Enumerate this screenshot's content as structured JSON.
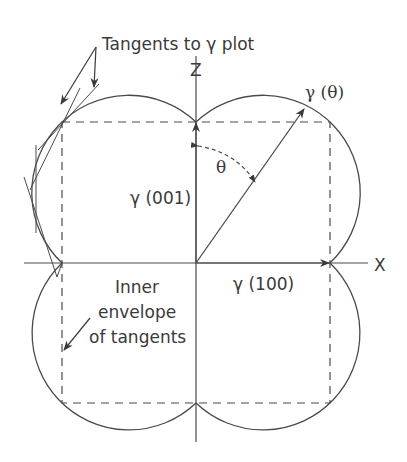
{
  "diagram": {
    "labels": {
      "tangents": "Tangents to γ plot",
      "z_axis": "Z",
      "x_axis": "X",
      "gamma_theta": "γ (θ)",
      "theta": "θ",
      "gamma_001": "γ (001)",
      "gamma_100": "γ (100)",
      "inner_envelope_line1": "Inner",
      "inner_envelope_line2": "envelope",
      "inner_envelope_line3": "of tangents"
    },
    "colors": {
      "stroke": "#4a4a4a",
      "text": "#3a3a3a",
      "background": "#ffffff"
    }
  }
}
